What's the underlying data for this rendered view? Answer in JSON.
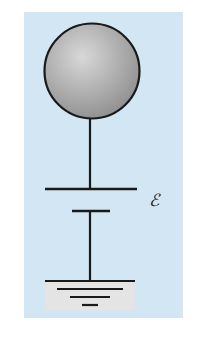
{
  "diagram": {
    "type": "circuit",
    "colors": {
      "page_background": "#ffffff",
      "panel_background": "#d2e6f4",
      "wire": "#1a1a1a",
      "sphere_fill_light": "#d4d4d4",
      "sphere_fill_dark": "#9a9a9a",
      "ground_fill": "#e4e4e4"
    },
    "components": [
      {
        "id": "sphere",
        "kind": "conducting-sphere"
      },
      {
        "id": "wire-top",
        "kind": "wire"
      },
      {
        "id": "battery",
        "kind": "battery",
        "label": "ℰ"
      },
      {
        "id": "wire-bottom",
        "kind": "wire"
      },
      {
        "id": "ground",
        "kind": "ground"
      }
    ],
    "battery_label": "ℰ"
  }
}
